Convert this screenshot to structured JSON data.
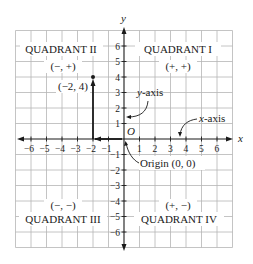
{
  "diagram": {
    "type": "coordinate-plane",
    "x_axis_label": "x",
    "y_axis_label": "y",
    "origin_letter": "O",
    "x_ticks": [
      "−6",
      "−5",
      "−4",
      "−3",
      "−2",
      "−1",
      "1",
      "2",
      "3",
      "4",
      "5",
      "6"
    ],
    "y_ticks_pos": [
      "6",
      "5",
      "4",
      "3",
      "2",
      "1"
    ],
    "y_ticks_neg": [
      "−1",
      "−2",
      "−3",
      "−4",
      "−5",
      "−6"
    ],
    "quadrants": {
      "q1": {
        "name": "QUADRANT I",
        "signs": "(+, +)"
      },
      "q2": {
        "name": "QUADRANT II",
        "signs": "(−, +)"
      },
      "q3": {
        "name": "QUADRANT III",
        "signs": "(−, −)"
      },
      "q4": {
        "name": "QUADRANT IV",
        "signs": "(+, −)"
      }
    },
    "point": {
      "label": "(−2, 4)",
      "x": -2,
      "y": 4
    },
    "annotations": {
      "y_axis_callout_italic": "y",
      "y_axis_callout_rest": "-axis",
      "x_axis_callout_italic": "x",
      "x_axis_callout_rest": "-axis",
      "origin_callout": "Origin  (0, 0)"
    },
    "colors": {
      "grid": "#b5b5b5",
      "axis": "#1a1a1a",
      "text": "#1a1a1a"
    }
  }
}
